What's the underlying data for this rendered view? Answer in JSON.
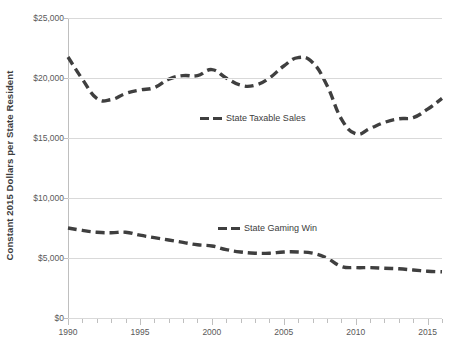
{
  "chart_data": {
    "type": "line",
    "title": "",
    "xlabel": "",
    "ylabel": "Constant 2015 Dollars per State Resident",
    "xlim": [
      1990,
      2016
    ],
    "ylim": [
      0,
      25000
    ],
    "grid": true,
    "legend_position": "inline",
    "y_ticks": [
      0,
      5000,
      10000,
      15000,
      20000,
      25000
    ],
    "y_tick_labels": [
      "$0",
      "$5,000",
      "$10,000",
      "$15,000",
      "$20,000",
      "$25,000"
    ],
    "x_ticks": [
      1990,
      1995,
      2000,
      2005,
      2010,
      2015
    ],
    "x_tick_labels": [
      "1990",
      "1995",
      "2000",
      "2005",
      "2010",
      "2015"
    ],
    "x": [
      1990,
      1991,
      1992,
      1993,
      1994,
      1995,
      1996,
      1997,
      1998,
      1999,
      2000,
      2001,
      2002,
      2003,
      2004,
      2005,
      2006,
      2007,
      2008,
      2009,
      2010,
      2011,
      2012,
      2013,
      2014,
      2015,
      2016
    ],
    "series": [
      {
        "name": "State Taxable Sales",
        "color": "#3f3f3f",
        "style": "dashed",
        "values": [
          21750,
          19900,
          18300,
          18200,
          18700,
          19000,
          19200,
          19900,
          20200,
          20200,
          20700,
          20000,
          19400,
          19400,
          20000,
          21000,
          21700,
          21300,
          19400,
          16600,
          15350,
          15800,
          16300,
          16600,
          16700,
          17400,
          18300
        ]
      },
      {
        "name": "State Gaming Win",
        "color": "#3f3f3f",
        "style": "dashed",
        "values": [
          7500,
          7300,
          7150,
          7100,
          7150,
          6900,
          6700,
          6500,
          6300,
          6100,
          6000,
          5700,
          5500,
          5400,
          5400,
          5500,
          5500,
          5400,
          5000,
          4300,
          4200,
          4200,
          4150,
          4100,
          4000,
          3900,
          3850
        ]
      }
    ],
    "legend_entries": [
      {
        "label": "State Taxable Sales",
        "swatch_color": "#3f3f3f"
      },
      {
        "label": "State Gaming Win",
        "swatch_color": "#3f3f3f"
      }
    ]
  },
  "axes": {
    "y_title": "Constant 2015 Dollars per State Resident"
  },
  "colors": {
    "series_line": "#3f3f3f",
    "gridline": "#d9d9d9",
    "axis_line": "#bfbfbf",
    "tick_text": "#595959",
    "background": "#ffffff"
  }
}
